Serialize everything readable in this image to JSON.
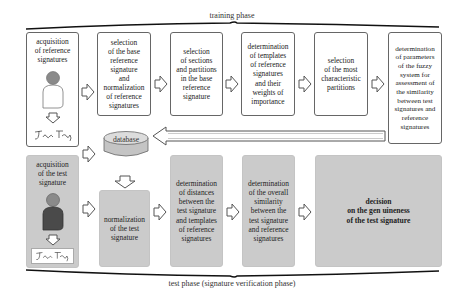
{
  "training_phase": {
    "label": "training phase",
    "steps": [
      {
        "id": "acquisition-reference",
        "text": "acquisition\nof reference\nsignatures"
      },
      {
        "id": "selection-base",
        "text": "selection\nof the base\nreference\nsignature\nand\nnormalization\nof reference\nsignatures"
      },
      {
        "id": "selection-sections",
        "text": "selection\nof sections\nand partitions\nin the base\nreference\nsignature"
      },
      {
        "id": "determination-templates",
        "text": "determination\nof templates\nof reference\nsignatures\nand their\nweights of\nimportance"
      },
      {
        "id": "selection-characteristic",
        "text": "selection\nof the most\ncharacteristic\npartitions"
      },
      {
        "id": "determination-fuzzy",
        "text": "determination\nof parameters\nof the fuzzy\nsystem for\nassessment of\nthe similarity\nbetween test\nsignatures and\nreference\nsignatures"
      }
    ]
  },
  "database": {
    "label": "database"
  },
  "test_phase": {
    "label": "test phase (signature verification phase)",
    "steps": [
      {
        "id": "acquisition-test",
        "text": "acquisition\nof the test\nsignature"
      },
      {
        "id": "normalization-test",
        "text": "normalization\nof the test\nsignature"
      },
      {
        "id": "determination-distances",
        "text": "determination\nof distances\nbetween the\ntest signature\nand templates\nof reference\nsignatures"
      },
      {
        "id": "determination-similarity",
        "text": "determination\nof the overall\nsimilarity\nbetween the\ntest signature\nand reference\nsignatures"
      },
      {
        "id": "decision",
        "text": "decision\non the gen uineness\nof the test signature"
      }
    ]
  },
  "signature_sample": {
    "text": "Jan Tatoug"
  },
  "colors": {
    "test_box_fill": "#cbcbcb",
    "border": "#666666",
    "person_white": "#ffffff",
    "person_dark": "#4a4a4a",
    "head": "#8a8a8a"
  }
}
